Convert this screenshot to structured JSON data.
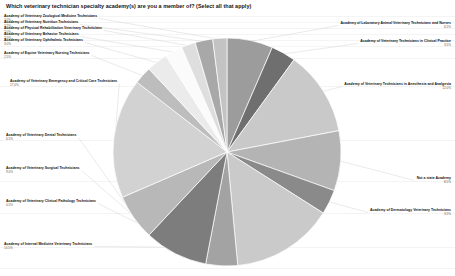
{
  "chart_data": {
    "type": "pie",
    "title": "Which veterinary technician specialty academy(s) are you a member of? (Select all that apply)",
    "xlabel": "",
    "ylabel": "",
    "legend_position": "callout-labels",
    "grid": true,
    "start_angle_deg": -90,
    "direction": "clockwise",
    "categories": [
      "Academy of Laboratory Animal Veterinary Technicians and Nurses",
      "Academy of Veterinary Technicians in Clinical Practice",
      "Academy of Veterinary Technicians in Anesthesia and Analgesia",
      "Not a state Academy",
      "Academy of Dermatology Veterinary Technicians",
      "Academy of Internal Medicine Veterinary Technicians",
      "Academy of Veterinary Clinical Pathology Technicians",
      "Academy of Veterinary Surgical Technicians",
      "Academy of Veterinary Dental Technicians",
      "Academy of Veterinary Emergency and Critical Care Technicians",
      "Academy of Equine Veterinary Nursing Technicians",
      "Academy of Veterinary Ophthalmic Technicians",
      "Academy of Veterinary Behavior Technicians",
      "Academy of Physical Rehabilitation Veterinary Technicians",
      "Academy of Veterinary Nutrition Technicians",
      "Academy of Veterinary Zoological Medicine Technicians"
    ],
    "values": [
      6.5,
      3.5,
      12.0,
      8.5,
      3.5,
      14.5,
      4.5,
      9.0,
      6.5,
      17.0,
      2.5,
      3.0,
      2.5,
      2.0,
      2.5,
      2.0
    ],
    "percent_labels": [
      "6.5%",
      "3.5%",
      "12.0%",
      "8.5%",
      "3.5%",
      "14.5%",
      "4.5%",
      "9.0%",
      "6.5%",
      "17.0%",
      "2.5%",
      "3.0%",
      "2.5%",
      "2.0%",
      "2.5%",
      "2.0%"
    ],
    "colors": [
      "#9c9c9c",
      "#6f6f6f",
      "#c9c9c9",
      "#b4b4b4",
      "#8a8a8a",
      "#cacaca",
      "#a3a3a3",
      "#7d7d7d",
      "#b8b8b8",
      "#d2d2d2",
      "#bdbdbd",
      "#ebebeb",
      "#fbfbfb",
      "#dedede",
      "#a8a8a8",
      "#c3c3c3"
    ]
  },
  "labels": {
    "left": [
      {
        "text": "Academy of Veterinary Zoological Medicine Technicians",
        "pct": "2.0%"
      },
      {
        "text": "Academy of Veterinary Nutrition Technicians",
        "pct": "2.5%"
      },
      {
        "text": "Academy of Physical Rehabilitation Veterinary Technicians",
        "pct": "2.0%"
      },
      {
        "text": "Academy of Veterinary Behavior Technicians",
        "pct": "2.5%"
      },
      {
        "text": "Academy of Veterinary Ophthalmic Technicians",
        "pct": "3.0%"
      },
      {
        "text": "Academy of Equine Veterinary Nursing Technicians",
        "pct": "2.5%"
      },
      {
        "text": "Academy of Veterinary Emergency and Critical Care Technicians",
        "pct": "17.0%"
      },
      {
        "text": "Academy of Veterinary Dental Technicians",
        "pct": "6.5%"
      },
      {
        "text": "Academy of Veterinary Surgical Technicians",
        "pct": "9.0%"
      },
      {
        "text": "Academy of Veterinary Clinical Pathology Technicians",
        "pct": "4.5%"
      },
      {
        "text": "Academy of Internal Medicine Veterinary Technicians",
        "pct": "14.5%"
      }
    ],
    "right": [
      {
        "text": "Academy of Laboratory Animal Veterinary Technicians and Nurses",
        "pct": "6.5%"
      },
      {
        "text": "Academy of Veterinary Technicians in Clinical Practice",
        "pct": "3.5%"
      },
      {
        "text": "Academy of Veterinary Technicians in Anesthesia and Analgesia",
        "pct": "12.0%"
      },
      {
        "text": "Not a state Academy",
        "pct": "8.5%"
      },
      {
        "text": "Academy of Dermatology Veterinary Technicians",
        "pct": "3.5%"
      }
    ]
  }
}
